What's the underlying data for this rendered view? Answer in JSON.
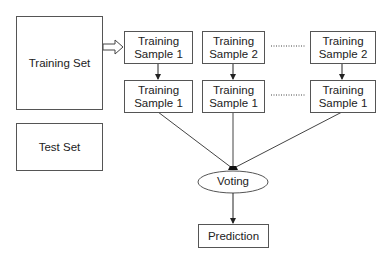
{
  "diagram": {
    "training_set": "Training Set",
    "test_set": "Test Set",
    "columns": [
      {
        "top_line1": "Training",
        "top_line2": "Sample 1",
        "bottom_line1": "Training",
        "bottom_line2": "Sample 1"
      },
      {
        "top_line1": "Training",
        "top_line2": "Sample 2",
        "bottom_line1": "Training",
        "bottom_line2": "Sample 1"
      },
      {
        "top_line1": "Training",
        "top_line2": "Sample 2",
        "bottom_line1": "Training",
        "bottom_line2": "Sample 1"
      }
    ],
    "voting": "Voting",
    "prediction": "Prediction"
  }
}
